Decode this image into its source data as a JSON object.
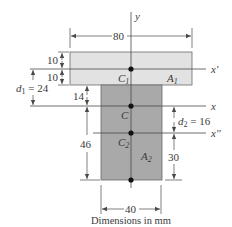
{
  "figure": {
    "caption": "Dimensions in mm",
    "colors": {
      "flange_fill": "#e2e2e2",
      "web_fill": "#a9a9a9",
      "line": "#4a4a4a",
      "text": "#3a3a3a"
    },
    "axes": {
      "y": "y",
      "x": "x",
      "x_prime": "x'",
      "x_double_prime": "x''"
    },
    "labels": {
      "C1": "C",
      "C1_sub": "1",
      "C": "C",
      "C2": "C",
      "C2_sub": "2",
      "A1": "A",
      "A1_sub": "1",
      "A2": "A",
      "A2_sub": "2"
    },
    "dimensions": {
      "flange_width": "80",
      "web_width": "40",
      "flange_top_half": "10",
      "flange_bottom_half": "10",
      "d1_label": "d",
      "d1_sub": "1",
      "d1_value": " = 24",
      "flange_to_centroid": "14",
      "centroid_to_bottom": "46",
      "d2_label": "d",
      "d2_sub": "2",
      "d2_value": " = 16",
      "c2_to_bottom": "30"
    }
  }
}
